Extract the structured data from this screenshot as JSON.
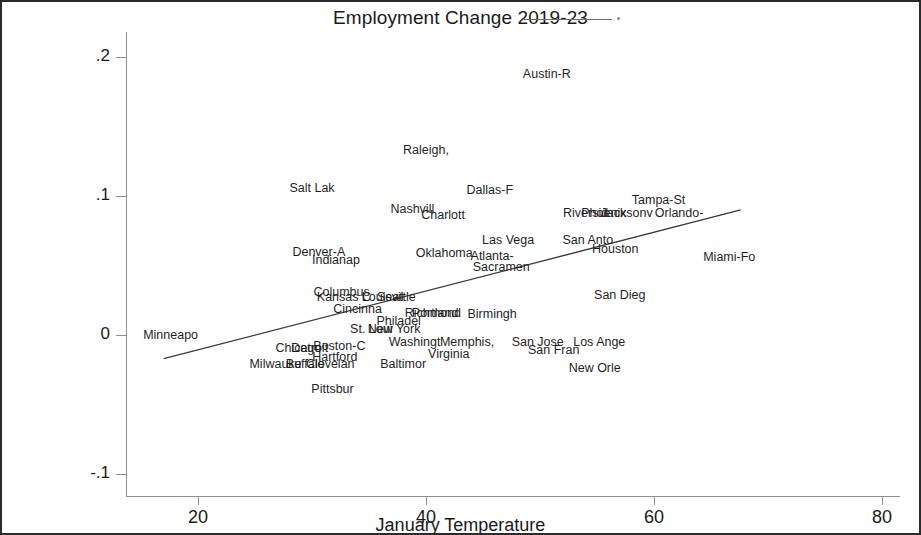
{
  "chart": {
    "title": "Employment Change 2019-23",
    "xlabel": "January Temperature",
    "ylabel": ""
  },
  "axes": {
    "y_ticks": [
      ".2",
      ".1",
      "0",
      "-.1"
    ],
    "x_ticks": [
      "20",
      "40",
      "60",
      "80"
    ]
  },
  "chart_data": {
    "type": "scatter",
    "title": "Employment Change 2019-23",
    "xlabel": "January Temperature",
    "ylabel": "",
    "xlim": [
      15,
      83
    ],
    "ylim": [
      -0.115,
      0.215
    ],
    "grid": false,
    "legend": "fitted line",
    "labels_as_markers": true,
    "points": [
      {
        "label": "Austin-R",
        "x": 50.6,
        "y": 0.188
      },
      {
        "label": "Raleigh,",
        "x": 40.0,
        "y": 0.133
      },
      {
        "label": "Salt Lak",
        "x": 30.0,
        "y": 0.106
      },
      {
        "label": "Dallas-F",
        "x": 45.6,
        "y": 0.104
      },
      {
        "label": "Tampa-St",
        "x": 60.4,
        "y": 0.097
      },
      {
        "label": "Nashvill",
        "x": 38.8,
        "y": 0.091
      },
      {
        "label": "Charlott",
        "x": 41.5,
        "y": 0.086
      },
      {
        "label": "Orlando-",
        "x": 62.2,
        "y": 0.088
      },
      {
        "label": "Riversid",
        "x": 54.0,
        "y": 0.088
      },
      {
        "label": "Phoenix",
        "x": 55.6,
        "y": 0.088
      },
      {
        "label": "Jacksonv",
        "x": 57.6,
        "y": 0.088
      },
      {
        "label": "Las Vega",
        "x": 47.2,
        "y": 0.068
      },
      {
        "label": "San Anto",
        "x": 54.2,
        "y": 0.068
      },
      {
        "label": "Houston",
        "x": 56.6,
        "y": 0.062
      },
      {
        "label": "Denver-A",
        "x": 30.6,
        "y": 0.06
      },
      {
        "label": "Oklahoma",
        "x": 41.6,
        "y": 0.059
      },
      {
        "label": "Atlanta-",
        "x": 45.8,
        "y": 0.057
      },
      {
        "label": "Indianap",
        "x": 32.1,
        "y": 0.054
      },
      {
        "label": "Sacramen",
        "x": 46.6,
        "y": 0.049
      },
      {
        "label": "Miami-Fo",
        "x": 66.6,
        "y": 0.056
      },
      {
        "label": "Columbus",
        "x": 32.6,
        "y": 0.031
      },
      {
        "label": "Kansas C",
        "x": 32.8,
        "y": 0.027
      },
      {
        "label": "Louisvil",
        "x": 36.2,
        "y": 0.027
      },
      {
        "label": "Seattle",
        "x": 37.4,
        "y": 0.027
      },
      {
        "label": "San Dieg",
        "x": 57.0,
        "y": 0.029
      },
      {
        "label": "Cincinna",
        "x": 34.0,
        "y": 0.019
      },
      {
        "label": "Richmond",
        "x": 40.6,
        "y": 0.016
      },
      {
        "label": "Portland",
        "x": 40.8,
        "y": 0.016
      },
      {
        "label": "Birmingh",
        "x": 45.8,
        "y": 0.015
      },
      {
        "label": "Philadel",
        "x": 37.6,
        "y": 0.01
      },
      {
        "label": "New York",
        "x": 37.2,
        "y": 0.004
      },
      {
        "label": "St. Loui",
        "x": 35.2,
        "y": 0.004
      },
      {
        "label": "Minneapo",
        "x": 17.6,
        "y": 0.0
      },
      {
        "label": "Washingt",
        "x": 39.0,
        "y": -0.005
      },
      {
        "label": "Memphis,",
        "x": 43.6,
        "y": -0.005
      },
      {
        "label": "San Jose",
        "x": 49.8,
        "y": -0.005
      },
      {
        "label": "Los Ange",
        "x": 55.2,
        "y": -0.005
      },
      {
        "label": "Boston-C",
        "x": 32.4,
        "y": -0.008
      },
      {
        "label": "Chicago",
        "x": 28.8,
        "y": -0.009
      },
      {
        "label": "Detroit",
        "x": 29.8,
        "y": -0.009
      },
      {
        "label": "San Fran",
        "x": 51.2,
        "y": -0.011
      },
      {
        "label": "Virginia",
        "x": 42.0,
        "y": -0.014
      },
      {
        "label": "Hartford",
        "x": 32.0,
        "y": -0.016
      },
      {
        "label": "Baltimor",
        "x": 38.0,
        "y": -0.021
      },
      {
        "label": "Milwauke",
        "x": 26.8,
        "y": -0.021
      },
      {
        "label": "Buffalo",
        "x": 29.4,
        "y": -0.021
      },
      {
        "label": "Clevelan",
        "x": 31.6,
        "y": -0.021
      },
      {
        "label": "New Orle",
        "x": 54.8,
        "y": -0.024
      },
      {
        "label": "Pittsbur",
        "x": 31.8,
        "y": -0.039
      }
    ],
    "fit_line": {
      "x": [
        17.0,
        67.6
      ],
      "y": [
        -0.017,
        0.09
      ]
    }
  }
}
